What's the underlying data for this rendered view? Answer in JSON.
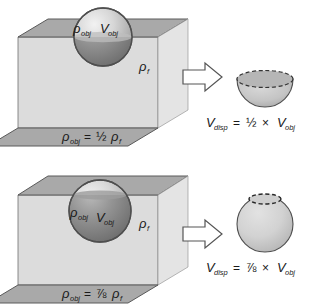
{
  "figure": {
    "background_color": "#ffffff"
  },
  "colors": {
    "fluid_top_surface": "#a9a9a9",
    "fluid_front_face": "#dcdcdc",
    "container_base": "#a9a9a9",
    "outline": "#4d4d4d",
    "sphere_light": "#d0d0d0",
    "sphere_dark": "#8f8f8f",
    "sphere_submerged": "#8a8a8a",
    "arrow_fill": "#ffffff",
    "arrow_outline": "#555555",
    "text": "#1a1a1a"
  },
  "cases": [
    {
      "id": "half-submerged",
      "sphere_label_density": "ρ",
      "sphere_label_density_sub": "obj",
      "sphere_label_volume": "V",
      "sphere_label_volume_sub": "obj",
      "fluid_label": "ρ",
      "fluid_label_sub": "f",
      "density_equation": {
        "lhs": "ρ",
        "lhs_sub": "obj",
        "operator": "=",
        "fraction": "½",
        "rhs": "ρ",
        "rhs_sub": "f"
      },
      "displaced_shape": "hemisphere-bowl",
      "displaced_equation": {
        "lhs": "V",
        "lhs_sub": "disp",
        "operator": "=",
        "fraction": "½",
        "times": "×",
        "rhs": "V",
        "rhs_sub": "obj"
      },
      "submerged_fraction": 0.5
    },
    {
      "id": "seven-eighths-submerged",
      "sphere_label_density": "ρ",
      "sphere_label_density_sub": "obj",
      "sphere_label_volume": "V",
      "sphere_label_volume_sub": "obj",
      "fluid_label": "ρ",
      "fluid_label_sub": "f",
      "density_equation": {
        "lhs": "ρ",
        "lhs_sub": "obj",
        "operator": "=",
        "fraction": "⅞",
        "rhs": "ρ",
        "rhs_sub": "f"
      },
      "displaced_shape": "sphere-minus-cap",
      "displaced_equation": {
        "lhs": "V",
        "lhs_sub": "disp",
        "operator": "=",
        "fraction": "⅞",
        "times": "×",
        "rhs": "V",
        "rhs_sub": "obj"
      },
      "submerged_fraction": 0.875
    }
  ],
  "arrow": {
    "name": "implies-arrow",
    "direction": "right"
  }
}
